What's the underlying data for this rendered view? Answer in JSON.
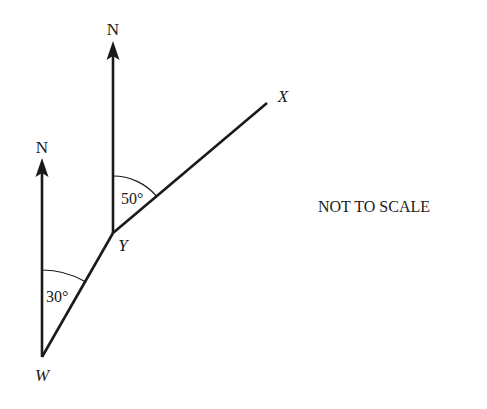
{
  "diagram": {
    "type": "bearings",
    "note": "NOT TO SCALE",
    "points": [
      {
        "name": "W",
        "x": 42,
        "y": 357
      },
      {
        "name": "Y",
        "x": 113,
        "y": 233
      },
      {
        "name": "X",
        "x": 267,
        "y": 103
      }
    ],
    "north_arrows": [
      {
        "at": "W",
        "label": "N"
      },
      {
        "at": "Y",
        "label": "N"
      }
    ],
    "angles": [
      {
        "at": "W",
        "label": "30°",
        "from": "N",
        "to": "Y"
      },
      {
        "at": "Y",
        "label": "50°",
        "from": "N",
        "to": "X"
      }
    ],
    "colors": {
      "line": "#1a1a1a",
      "background": "#ffffff"
    }
  }
}
